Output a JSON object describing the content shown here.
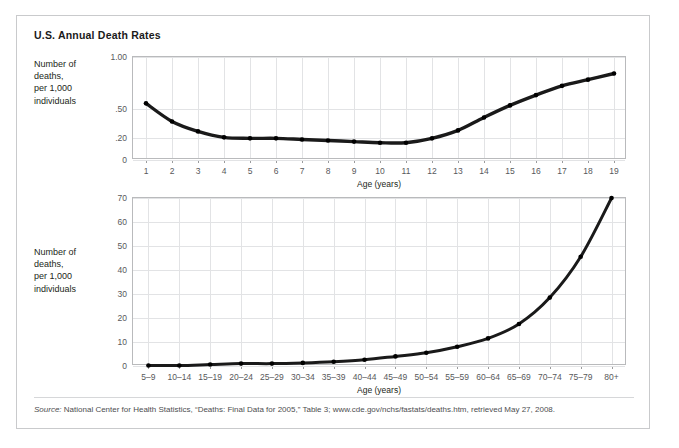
{
  "figure": {
    "title": "U.S. Annual Death Rates",
    "source_prefix": "Source:",
    "source_text": " National Center for Health Statistics, “Deaths: Final Data for 2005,” Table 3; www.cde.gov/nchs/fastats/deaths.htm, retrieved May 27, 2008.",
    "border_color": "#c9cacc",
    "line_color": "#1a1a1a",
    "grid_color": "#e2e3e5"
  },
  "panels": [
    {
      "id": "top",
      "y_axis_caption": "Number of\ndeaths,\nper 1,000\nindividuals",
      "x_axis_title": "Age (years)",
      "y_tick_labels": [
        "1.00",
        ".50",
        ".20",
        "0"
      ],
      "x_tick_labels": [
        "1",
        "2",
        "3",
        "4",
        "5",
        "6",
        "7",
        "8",
        "9",
        "10",
        "11",
        "12",
        "13",
        "14",
        "15",
        "16",
        "17",
        "18",
        "19"
      ]
    },
    {
      "id": "bottom",
      "y_axis_caption": "Number of\ndeaths,\nper 1,000\nindividuals",
      "x_axis_title": "Age (years)",
      "y_tick_labels": [
        "70",
        "60",
        "50",
        "40",
        "30",
        "20",
        "10",
        "0"
      ],
      "x_tick_labels": [
        "5–9",
        "10–14",
        "15–19",
        "20–24",
        "25–29",
        "30–34",
        "35–39",
        "40–44",
        "45–49",
        "50–54",
        "55–59",
        "60–64",
        "65–69",
        "70–74",
        "75–79",
        "80+"
      ]
    }
  ],
  "chart_data": [
    {
      "type": "line",
      "id": "death-rate-ages-1-19",
      "title": "U.S. Annual Death Rates",
      "xlabel": "Age (years)",
      "ylabel": "Number of deaths, per 1,000 individuals",
      "categories": [
        "1",
        "2",
        "3",
        "4",
        "5",
        "6",
        "7",
        "8",
        "9",
        "10",
        "11",
        "12",
        "13",
        "14",
        "15",
        "16",
        "17",
        "18",
        "19"
      ],
      "x": [
        1,
        2,
        3,
        4,
        5,
        6,
        7,
        8,
        9,
        10,
        11,
        12,
        13,
        14,
        15,
        16,
        17,
        18,
        19
      ],
      "values": [
        0.55,
        0.37,
        0.27,
        0.21,
        0.2,
        0.2,
        0.19,
        0.18,
        0.17,
        0.16,
        0.16,
        0.2,
        0.28,
        0.41,
        0.53,
        0.63,
        0.72,
        0.78,
        0.84
      ],
      "y_tick_values": [
        1.0,
        0.5,
        0.2,
        0.0
      ],
      "y_tick_labels": [
        "1.00",
        ".50",
        ".20",
        "0"
      ],
      "y_scale": "nonlinear-compressed",
      "ylim": [
        0,
        1.0
      ],
      "grid": true,
      "legend": "none",
      "markers": true
    },
    {
      "type": "line",
      "id": "death-rate-ages-5-80plus",
      "title": "U.S. Annual Death Rates",
      "xlabel": "Age (years)",
      "ylabel": "Number of deaths, per 1,000 individuals",
      "categories": [
        "5–9",
        "10–14",
        "15–19",
        "20–24",
        "25–29",
        "30–34",
        "35–39",
        "40–44",
        "45–49",
        "50–54",
        "55–59",
        "60–64",
        "65–69",
        "70–74",
        "75–79",
        "80+"
      ],
      "values": [
        0.2,
        0.2,
        0.6,
        1.0,
        1.0,
        1.3,
        1.8,
        2.6,
        4.0,
        5.5,
        8.0,
        11.5,
        17.5,
        28.5,
        45.5,
        70.0
      ],
      "y_tick_values": [
        0,
        10,
        20,
        30,
        40,
        50,
        60,
        70
      ],
      "y_tick_labels": [
        "0",
        "10",
        "20",
        "30",
        "40",
        "50",
        "60",
        "70"
      ],
      "y_scale": "linear",
      "ylim": [
        0,
        70
      ],
      "grid": true,
      "legend": "none",
      "markers": true
    }
  ]
}
